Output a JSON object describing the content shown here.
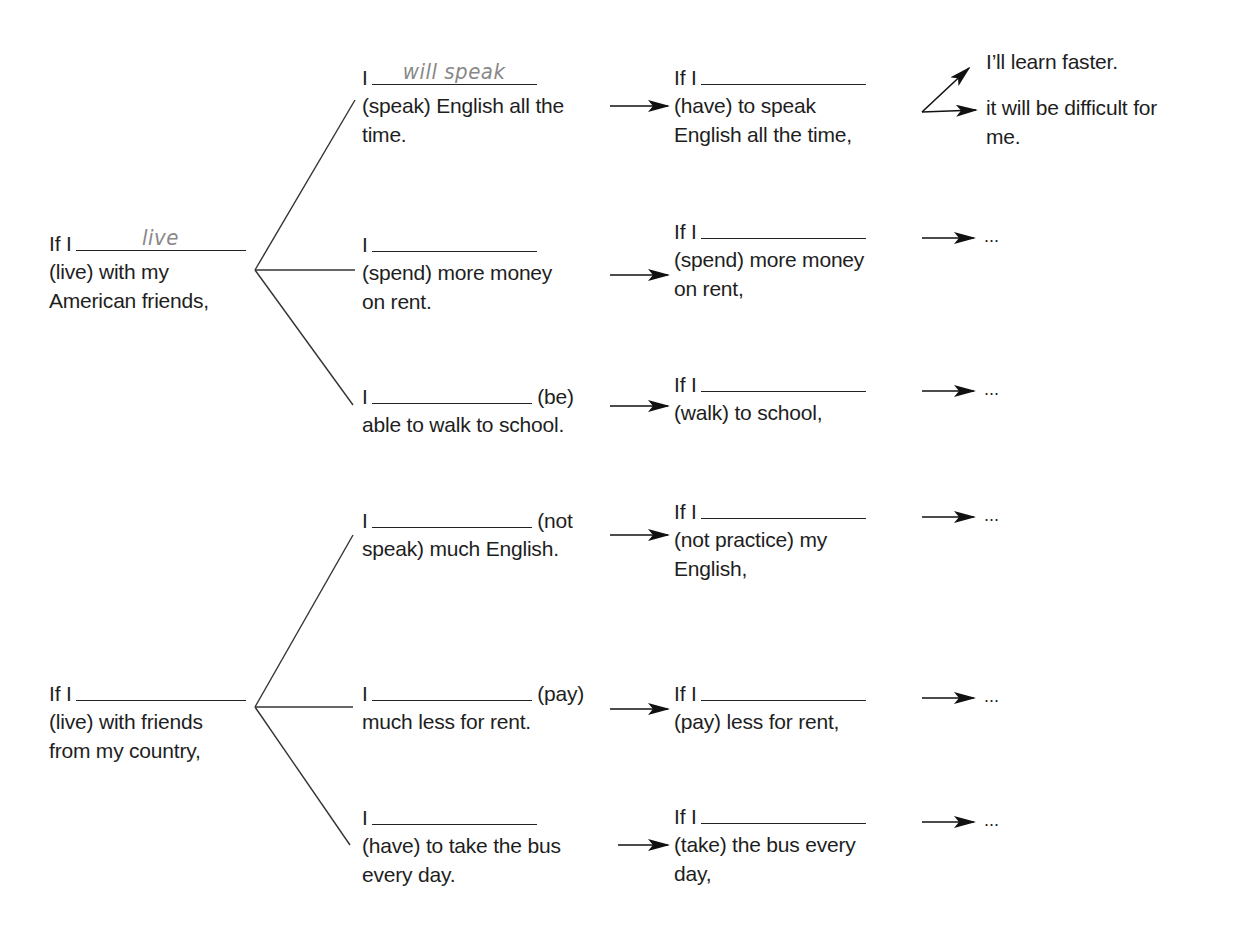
{
  "diagram": {
    "branches": [
      {
        "condition": {
          "line1_prefix": "If I",
          "blank_answer": "live",
          "line2": "(live) with my",
          "line3": "American friends,"
        },
        "results": [
          {
            "line1_prefix": "I",
            "blank_answer": "will speak",
            "line1_suffix": "",
            "line2": "(speak) English all the",
            "line3": "time.",
            "next_condition": {
              "line1_prefix": "If I",
              "blank_answer": "",
              "line2": "(have) to speak",
              "line3": "English all the time,"
            },
            "outcomes": [
              "I’ll learn faster.",
              "it will be difficult for",
              "me."
            ]
          },
          {
            "line1_prefix": "I",
            "blank_answer": "",
            "line1_suffix": "",
            "line2": "(spend) more money",
            "line3": "on rent.",
            "next_condition": {
              "line1_prefix": "If I",
              "blank_answer": "",
              "line2": "(spend) more money",
              "line3": "on rent,"
            },
            "outcome_ellipsis": "..."
          },
          {
            "line1_prefix": "I",
            "blank_answer": "",
            "line1_suffix": "(be)",
            "line2": "able to walk to school.",
            "line3": "",
            "next_condition": {
              "line1_prefix": "If I",
              "blank_answer": "",
              "line2": "(walk) to school,",
              "line3": ""
            },
            "outcome_ellipsis": "..."
          }
        ]
      },
      {
        "condition": {
          "line1_prefix": "If I",
          "blank_answer": "",
          "line2": "(live) with friends",
          "line3": "from my country,"
        },
        "results": [
          {
            "line1_prefix": "I",
            "blank_answer": "",
            "line1_suffix": "(not",
            "line2": "speak) much English.",
            "line3": "",
            "next_condition": {
              "line1_prefix": "If I",
              "blank_answer": "",
              "line2": "(not practice) my",
              "line3": "English,"
            },
            "outcome_ellipsis": "..."
          },
          {
            "line1_prefix": "I",
            "blank_answer": "",
            "line1_suffix": "(pay)",
            "line2": "much less for rent.",
            "line3": "",
            "next_condition": {
              "line1_prefix": "If I",
              "blank_answer": "",
              "line2": "(pay) less for rent,",
              "line3": ""
            },
            "outcome_ellipsis": "..."
          },
          {
            "line1_prefix": "I",
            "blank_answer": "",
            "line1_suffix": "",
            "line2": "(have) to take the bus",
            "line3": "every day.",
            "next_condition": {
              "line1_prefix": "If I",
              "blank_answer": "",
              "line2": "(take) the bus every",
              "line3": "day,"
            },
            "outcome_ellipsis": "..."
          }
        ]
      }
    ]
  },
  "colors": {
    "ink": "#1e1e1e",
    "handwriting": "#888888",
    "background": "#ffffff"
  }
}
